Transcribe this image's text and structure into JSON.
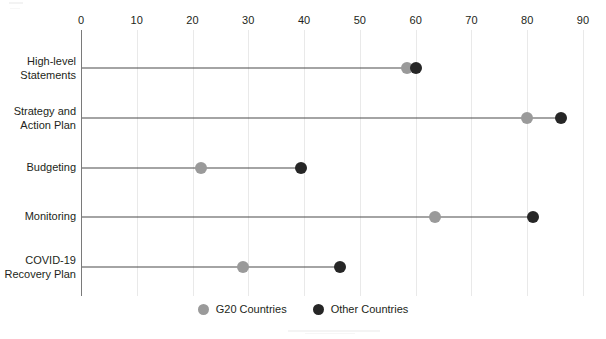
{
  "chart_data": {
    "type": "bar",
    "subtype": "dumbbell-lollipop",
    "title": "",
    "subtitle": "",
    "xlabel": "",
    "ylabel": "",
    "xlim": [
      0,
      90
    ],
    "xticks": [
      0,
      10,
      20,
      30,
      40,
      50,
      60,
      70,
      80,
      90
    ],
    "xtick_labels": [
      "0",
      "10",
      "20",
      "30",
      "40",
      "50",
      "60",
      "70",
      "80",
      "90"
    ],
    "grid": true,
    "grid_axis": "x",
    "legend_position": "bottom-center",
    "categories": [
      "High-level\nStatements",
      "Strategy and\nAction Plan",
      "Budgeting",
      "Monitoring",
      "COVID-19\nRecovery Plan"
    ],
    "series": [
      {
        "name": "G20 Countries",
        "color": "#9a9a9a",
        "values": [
          58.5,
          80,
          21.5,
          63.5,
          29
        ]
      },
      {
        "name": "Other Countries",
        "color": "#262626",
        "values": [
          60,
          86,
          39.5,
          81,
          46.5
        ]
      }
    ]
  },
  "axis": {
    "ticks": [
      {
        "label": "0"
      },
      {
        "label": "10"
      },
      {
        "label": "20"
      },
      {
        "label": "30"
      },
      {
        "label": "40"
      },
      {
        "label": "50"
      },
      {
        "label": "60"
      },
      {
        "label": "70"
      },
      {
        "label": "80"
      },
      {
        "label": "90"
      }
    ]
  },
  "rows": [
    {
      "label": "High-level\nStatements",
      "g20": 58.5,
      "other": 60
    },
    {
      "label": "Strategy and\nAction Plan",
      "g20": 80,
      "other": 86
    },
    {
      "label": "Budgeting",
      "g20": 21.5,
      "other": 39.5
    },
    {
      "label": "Monitoring",
      "g20": 63.5,
      "other": 81
    },
    {
      "label": "COVID-19\nRecovery Plan",
      "g20": 29,
      "other": 46.5
    }
  ],
  "legend": {
    "items": [
      {
        "label": "G20 Countries",
        "color": "#9a9a9a"
      },
      {
        "label": "Other Countries",
        "color": "#262626"
      }
    ]
  },
  "colors": {
    "g20": "#9a9a9a",
    "other": "#262626",
    "connector": "#4a4a4a",
    "axis": "#7a7a7a",
    "grid": "#e9e9e9",
    "text": "#231f20",
    "background": "#ffffff"
  }
}
